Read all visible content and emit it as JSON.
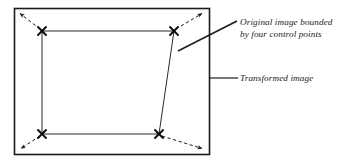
{
  "figure": {
    "background_color": "#ffffff",
    "stroke_color": "#1a1a1a",
    "annotations": {
      "original_image": {
        "line1": "Original image bounded",
        "line2": "by four control points",
        "leader": "diagonal-leader-line"
      },
      "transformed_image": {
        "line1": "Transformed image",
        "leader": "horizontal-leader-line"
      }
    },
    "shapes": {
      "outer_rectangle": {
        "name": "transformed-image-frame",
        "x": 14,
        "y": 8,
        "width": 196,
        "height": 147
      },
      "inner_quadrilateral": {
        "name": "original-image-quad",
        "points": "42,31 174,31 159,134 42,134"
      }
    },
    "control_points": [
      {
        "label": "top-left",
        "x": 42,
        "y": 31
      },
      {
        "label": "top-right",
        "x": 174,
        "y": 31
      },
      {
        "label": "bottom-right",
        "x": 159,
        "y": 134
      },
      {
        "label": "bottom-left",
        "x": 42,
        "y": 134
      }
    ],
    "displacement_arrows": [
      {
        "label": "top-left-arrow",
        "x1": 40,
        "y1": 29,
        "x2": 19,
        "y2": 13
      },
      {
        "label": "top-right-arrow",
        "x1": 176,
        "y1": 29,
        "x2": 203,
        "y2": 13
      },
      {
        "label": "bottom-right-arrow",
        "x1": 162,
        "y1": 136,
        "x2": 203,
        "y2": 149
      },
      {
        "label": "bottom-left-arrow",
        "x1": 40,
        "y1": 136,
        "x2": 21,
        "y2": 149
      }
    ],
    "leaders": {
      "original_leader": {
        "x1": 178,
        "y1": 51,
        "x2": 237,
        "y2": 21
      },
      "transformed_leader": {
        "x1": 210,
        "y1": 78,
        "x2": 238,
        "y2": 78
      }
    },
    "text_positions": {
      "original_line1": {
        "x": 240,
        "y": 25
      },
      "original_line2": {
        "x": 240,
        "y": 37
      },
      "transformed_line1": {
        "x": 240,
        "y": 81
      }
    }
  }
}
